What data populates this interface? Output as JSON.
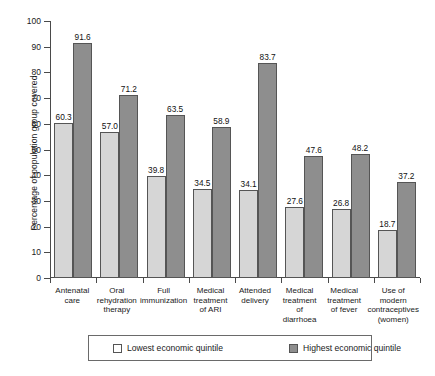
{
  "chart_data": {
    "type": "bar",
    "title": "",
    "xlabel": "",
    "ylabel": "Percentage of population group covered",
    "ylim": [
      0,
      100
    ],
    "yticks": [
      0,
      10,
      20,
      30,
      40,
      50,
      60,
      70,
      80,
      90,
      100
    ],
    "grid": false,
    "legend_position": "bottom",
    "categories": [
      "Antenatal care",
      "Oral rehydration therapy",
      "Full immunization",
      "Medical treatment of ARI",
      "Attended delivery",
      "Medical treatment of diarrhoea",
      "Medical treatment of fever",
      "Use of modern contraceptives (women)"
    ],
    "category_lines": [
      [
        "Antenatal",
        "care"
      ],
      [
        "Oral",
        "rehydration",
        "therapy"
      ],
      [
        "Full",
        "immunization"
      ],
      [
        "Medical",
        "treatment",
        "of ARI"
      ],
      [
        "Attended",
        "delivery"
      ],
      [
        "Medical",
        "treatment",
        "of diarrhoea"
      ],
      [
        "Medical",
        "treatment",
        "of fever"
      ],
      [
        "Use of",
        "modern",
        "contraceptives",
        "(women)"
      ]
    ],
    "series": [
      {
        "name": "Lowest economic quintile",
        "color": "#d6d6d6",
        "values": [
          60.3,
          57.0,
          39.8,
          34.5,
          34.1,
          27.6,
          26.8,
          18.7
        ]
      },
      {
        "name": "Highest economic quintile",
        "color": "#8e8e8e",
        "values": [
          91.6,
          71.2,
          63.5,
          58.9,
          83.7,
          47.6,
          48.2,
          37.2
        ]
      }
    ]
  },
  "legend": {
    "items": [
      {
        "label": "Lowest economic quintile",
        "swatch": "low"
      },
      {
        "label": "Highest economic quintile",
        "swatch": "high"
      }
    ]
  }
}
